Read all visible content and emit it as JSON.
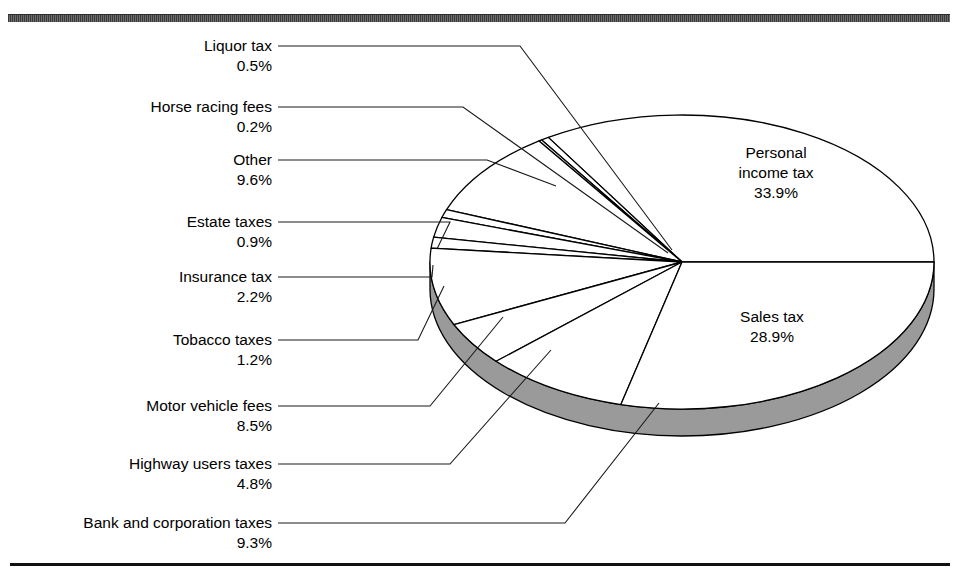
{
  "figure": {
    "background_color": "#ffffff",
    "rule_color": "#111111",
    "top_bar_color": "#4a4a4a",
    "pie_face_color": "#ffffff",
    "pie_wall_color": "#9a9a9a",
    "outline_color": "#000000"
  },
  "chart_data": {
    "type": "pie",
    "title": "",
    "subtitle": "",
    "xlabel": "",
    "ylabel": "",
    "legend_position": "callout-labels",
    "grid": false,
    "depth_3d": true,
    "start_angle_deg": 0,
    "direction": "counterclockwise",
    "units": "percent",
    "total": 100.0,
    "categories": [
      "Personal income tax",
      "Liquor tax",
      "Horse racing fees",
      "Other",
      "Estate taxes",
      "Insurance tax",
      "Tobacco taxes",
      "Motor vehicle fees",
      "Highway users taxes",
      "Bank and corporation taxes",
      "Sales tax"
    ],
    "values": [
      33.9,
      0.5,
      0.2,
      9.6,
      0.9,
      2.2,
      1.2,
      8.5,
      4.8,
      9.3,
      28.9
    ],
    "slices": [
      {
        "label": "Personal income tax",
        "value": 33.9,
        "percent_text": "33.9%",
        "placement": "inside"
      },
      {
        "label": "Liquor tax",
        "value": 0.5,
        "percent_text": "0.5%",
        "placement": "callout-left"
      },
      {
        "label": "Horse racing fees",
        "value": 0.2,
        "percent_text": "0.2%",
        "placement": "callout-left"
      },
      {
        "label": "Other",
        "value": 9.6,
        "percent_text": "9.6%",
        "placement": "callout-left"
      },
      {
        "label": "Estate taxes",
        "value": 0.9,
        "percent_text": "0.9%",
        "placement": "callout-left"
      },
      {
        "label": "Insurance tax",
        "value": 2.2,
        "percent_text": "2.2%",
        "placement": "callout-left"
      },
      {
        "label": "Tobacco taxes",
        "value": 1.2,
        "percent_text": "1.2%",
        "placement": "callout-left"
      },
      {
        "label": "Motor vehicle fees",
        "value": 8.5,
        "percent_text": "8.5%",
        "placement": "callout-left"
      },
      {
        "label": "Highway users taxes",
        "value": 4.8,
        "percent_text": "4.8%",
        "placement": "callout-left"
      },
      {
        "label": "Bank and corporation taxes",
        "value": 9.3,
        "percent_text": "9.3%",
        "placement": "callout-left"
      },
      {
        "label": "Sales tax",
        "value": 28.9,
        "percent_text": "28.9%",
        "placement": "inside"
      }
    ]
  },
  "labels": {
    "liquor_tax": {
      "name": "Liquor tax",
      "pct": "0.5%"
    },
    "horse_racing_fees": {
      "name": "Horse racing fees",
      "pct": "0.2%"
    },
    "other": {
      "name": "Other",
      "pct": "9.6%"
    },
    "estate_taxes": {
      "name": "Estate taxes",
      "pct": "0.9%"
    },
    "insurance_tax": {
      "name": "Insurance tax",
      "pct": "2.2%"
    },
    "tobacco_taxes": {
      "name": "Tobacco taxes",
      "pct": "1.2%"
    },
    "motor_vehicle_fees": {
      "name": "Motor vehicle fees",
      "pct": "8.5%"
    },
    "highway_users_taxes": {
      "name": "Highway users taxes",
      "pct": "4.8%"
    },
    "bank_and_corporation_taxes": {
      "name": "Bank and corporation taxes",
      "pct": "9.3%"
    },
    "personal_income_tax": {
      "line1": "Personal",
      "line2": "income tax",
      "pct": "33.9%"
    },
    "sales_tax": {
      "line1": "Sales tax",
      "pct": "28.9%"
    }
  }
}
